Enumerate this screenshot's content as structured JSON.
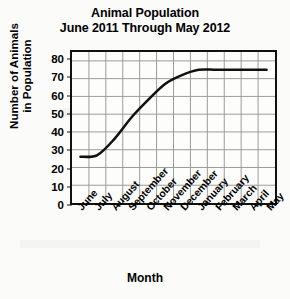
{
  "chart_data": {
    "type": "line",
    "title": "Animal Population",
    "subtitle": "June 2011 Through May 2012",
    "title_lines": [
      "Animal Population",
      "June 2011 Through May 2012"
    ],
    "xlabel": "Month",
    "ylabel": "Number of Animals in Population",
    "ylabel_lines": [
      "Number of Animals",
      "in Population"
    ],
    "categories": [
      "June",
      "July",
      "August",
      "September",
      "October",
      "November",
      "December",
      "January",
      "February",
      "March",
      "April",
      "May"
    ],
    "values": [
      26,
      27,
      36,
      48,
      58,
      67,
      72,
      75,
      75,
      75,
      75,
      75
    ],
    "ylim": [
      0,
      85
    ],
    "y_ticks": [
      0,
      10,
      20,
      30,
      40,
      50,
      60,
      70,
      80
    ],
    "y_tick_labels": [
      "0",
      "10",
      "20",
      "30",
      "40",
      "50",
      "60",
      "70",
      "80"
    ],
    "grid": true,
    "grid_color": "#9a9a9a",
    "line_color": "#111111",
    "legend": null,
    "legend_position": "none",
    "series": [
      {
        "name": "Animal Population",
        "values": [
          26,
          27,
          36,
          48,
          58,
          67,
          72,
          75,
          75,
          75,
          75,
          75
        ]
      }
    ]
  }
}
